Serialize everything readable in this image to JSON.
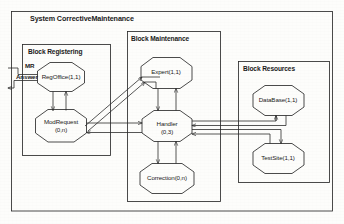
{
  "system": {
    "title": "System CorrectiveMaintenance"
  },
  "blocks": [
    {
      "id": "registering",
      "title": "Block Registering"
    },
    {
      "id": "maintenance",
      "title": "Block Maintenance"
    },
    {
      "id": "resources",
      "title": "Block Resources"
    }
  ],
  "processes": [
    {
      "id": "regoffice",
      "line1": "RegOffice(1,1)",
      "line2": ""
    },
    {
      "id": "modrequest",
      "line1": "ModRequest",
      "line2": "(0,n)"
    },
    {
      "id": "expert",
      "line1": "Expert(1,1)",
      "line2": ""
    },
    {
      "id": "handler",
      "line1": "Handler",
      "line2": "(0,3)"
    },
    {
      "id": "correction",
      "line1": "Correction(0,n)",
      "line2": ""
    },
    {
      "id": "database",
      "line1": "DataBase(1,1)",
      "line2": ""
    },
    {
      "id": "testsite",
      "line1": "TestSite(1,1)",
      "line2": ""
    }
  ],
  "channels": [
    {
      "id": "mr",
      "label": "MR"
    },
    {
      "id": "answer",
      "label": "Answer"
    }
  ],
  "colors": {
    "stroke": "#2b2b2b",
    "background": "#fdfdfb",
    "text": "#1a1a1a"
  }
}
